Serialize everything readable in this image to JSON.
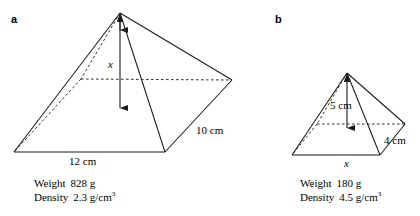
{
  "figure": {
    "background_color": "#ffffff",
    "stroke_color": "#1a1a1a",
    "panels": [
      {
        "letter": "a",
        "shape": "square-based pyramid",
        "dimensions": {
          "height_label": "x",
          "base_label": "12 cm",
          "slant_label": "10 cm"
        },
        "stats": {
          "weight_key": "Weight",
          "weight_value": "828 g",
          "density_key": "Density",
          "density_value": "2.3 g/cm",
          "density_exponent": "3"
        }
      },
      {
        "letter": "b",
        "shape": "square-based pyramid",
        "dimensions": {
          "height_label": "5 cm",
          "base_label": "x",
          "slant_label": "4 cm"
        },
        "stats": {
          "weight_key": "Weight",
          "weight_value": "180 g",
          "density_key": "Density",
          "density_value": "4.5 g/cm",
          "density_exponent": "3"
        }
      }
    ]
  }
}
